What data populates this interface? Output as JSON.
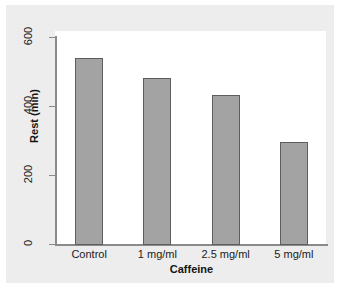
{
  "chart_data": {
    "type": "bar",
    "title": "",
    "xlabel": "Caffeine",
    "ylabel": "Rest (min)",
    "categories": [
      "Control",
      "1 mg/ml",
      "2.5 mg/ml",
      "5 mg/ml"
    ],
    "values": [
      539,
      481,
      432,
      296
    ],
    "ylim": [
      0,
      600
    ],
    "yticks": [
      0,
      200,
      400,
      600
    ],
    "ytick_labels": [
      "0",
      "200",
      "400",
      "600"
    ],
    "grid": false,
    "legend": null,
    "bar_color": "#a3a3a3",
    "bar_edge_color": "#5e5e5e",
    "axis_color": "#8a8a8a",
    "panel_background": "#ededed",
    "plot_background": "#ffffff"
  }
}
